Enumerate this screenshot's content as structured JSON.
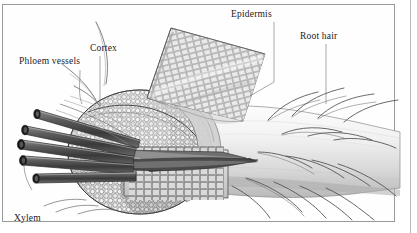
{
  "figure": {
    "style": "pen-and-ink botanical engraving, greyscale",
    "frame_color": "#9a9a9a",
    "background_color": "#ffffff",
    "ink_color": "#22201e"
  },
  "labels": {
    "epidermis": "Epidermis",
    "root_hair": "Root hair",
    "cortex": "Cortex",
    "phloem_vessels": "Phloem vessels",
    "xylem_vessels_line1": "Xylem",
    "xylem_vessels_line2": "vessels"
  },
  "parts": {
    "epidermis_sheet": "peeled-back grid sheet of rectangular epidermal cells",
    "cortex_mass": "rounded packed cortex cells in cut face",
    "xylem_tubes": "five dark cylindrical xylem vessel tubes with open elliptical ends",
    "phloem_strands": "phloem vessel strands above the xylem bundle",
    "root_body": "smooth tapering root cylinder",
    "root_hairs": "slender curved hairs projecting from the root surface"
  },
  "counts": {
    "xylem_tubes": 5,
    "labels": 5
  }
}
